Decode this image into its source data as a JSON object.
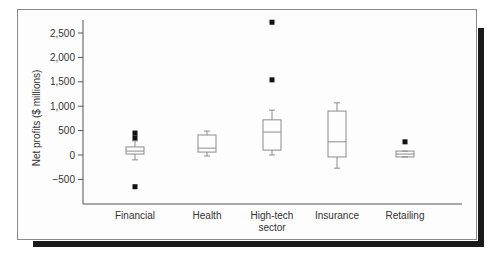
{
  "chart_data": {
    "type": "box",
    "title": "",
    "xlabel": "",
    "ylabel": "Net profits ($ millions)",
    "ylim": [
      -900,
      2800
    ],
    "yticks": [
      -500,
      0,
      500,
      1000,
      1500,
      2000,
      2500
    ],
    "ytick_labels": [
      "-500",
      "0",
      "500",
      "1,000",
      "1,500",
      "2,000",
      "2,500"
    ],
    "grid": false,
    "legend": null,
    "categories": [
      "Financial",
      "Health",
      "High-tech sector",
      "Insurance",
      "Retailing"
    ],
    "category_lines": [
      [
        "Financial"
      ],
      [
        "Health"
      ],
      [
        "High-tech",
        "sector"
      ],
      [
        "Insurance"
      ],
      [
        "Retailing"
      ]
    ],
    "boxes": [
      {
        "category": "Financial",
        "whisker_low": -100,
        "q1": 20,
        "median": 80,
        "q3": 165,
        "whisker_high": 290,
        "outliers": [
          450,
          350,
          -650
        ]
      },
      {
        "category": "Health",
        "whisker_low": -20,
        "q1": 60,
        "median": 140,
        "q3": 410,
        "whisker_high": 490,
        "outliers": []
      },
      {
        "category": "High-tech sector",
        "whisker_low": 0,
        "q1": 100,
        "median": 470,
        "q3": 720,
        "whisker_high": 920,
        "outliers": [
          2720,
          1540
        ]
      },
      {
        "category": "Insurance",
        "whisker_low": -270,
        "q1": -40,
        "median": 270,
        "q3": 900,
        "whisker_high": 1070,
        "outliers": []
      },
      {
        "category": "Retailing",
        "whisker_low": -40,
        "q1": -40,
        "median": 20,
        "q3": 80,
        "whisker_high": 80,
        "outliers": [
          270
        ]
      }
    ]
  },
  "colors": {
    "box_stroke": "#8c8c8c",
    "outlier": "#111111",
    "axis": "#555555",
    "shadow": "#1a1a1a"
  }
}
